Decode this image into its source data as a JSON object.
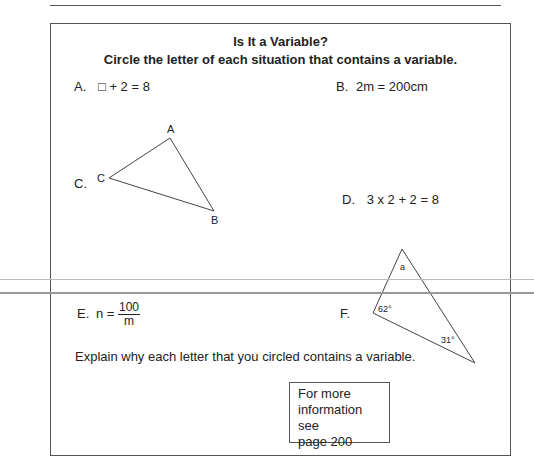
{
  "worksheet": {
    "title": "Is It a Variable?",
    "instruction": "Circle the letter of each situation that contains a variable.",
    "items": [
      {
        "letter": "A.",
        "content": "□ + 2 = 8"
      },
      {
        "letter": "B.",
        "content": "2m = 200cm"
      },
      {
        "letter": "C.",
        "content": "triangle",
        "vertices": [
          "A",
          "B",
          "C"
        ]
      },
      {
        "letter": "D.",
        "content": "3 x 2 + 2 = 8"
      },
      {
        "letter": "E.",
        "content_prefix": "n =",
        "numerator": "100",
        "denominator": "m"
      },
      {
        "letter": "F.",
        "content": "triangle",
        "angles": [
          "a",
          "62°",
          "31°"
        ]
      }
    ],
    "explain": "Explain why each letter that you circled contains a variable.",
    "info_box": {
      "line1": "For more",
      "line2": "information see",
      "line3": "page 200"
    }
  }
}
